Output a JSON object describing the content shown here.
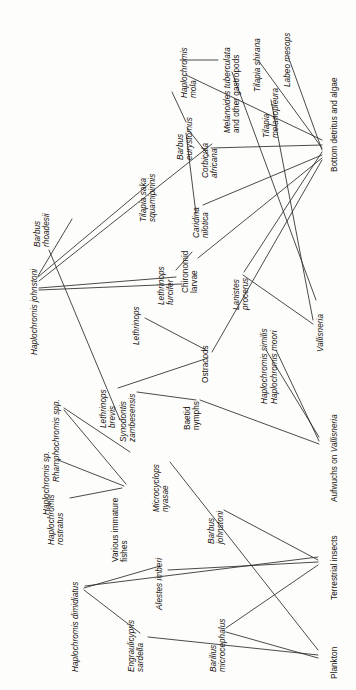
{
  "figure": {
    "type": "food-web-diagram",
    "orientation": "labels rotated 90 degrees counter-clockwise",
    "background_color": "#fdfdfb",
    "line_color": "#2b2b2b",
    "text_color": "#15110d",
    "width": 356,
    "height": 690
  },
  "nodes": [
    {
      "id": "haplochromis_johnstoni",
      "label": "Haplochromis johnstoni",
      "lines": [
        "Haplochromis johnstoni"
      ],
      "style": "italic",
      "x": 30,
      "y": 355,
      "anchor_x": 38,
      "anchor_y": 275
    },
    {
      "id": "barbus_rhoadesii",
      "label": "Barbus rhoadesii",
      "lines": [
        "Barbus",
        "rhoadesii"
      ],
      "style": "italic",
      "x": 33,
      "y": 247,
      "anchor_x": 46,
      "anchor_y": 223
    },
    {
      "id": "rhamphochromis_spp",
      "label": "Rhamphochromis spp.",
      "lines": [
        "Rhamphochromis spp."
      ],
      "style": "italic",
      "x": 52,
      "y": 482,
      "anchor_x": 60,
      "anchor_y": 404
    },
    {
      "id": "haplochromis_sp",
      "label": "Haplochromis sp.",
      "lines": [
        "Haplochromis sp."
      ],
      "style": "italic",
      "x": 42,
      "y": 515,
      "anchor_x": 50,
      "anchor_y": 455
    },
    {
      "id": "haplochromis_rostratus",
      "label": "Haplochromis rostratus",
      "lines": [
        "Haplochromis",
        "rostratus"
      ],
      "style": "italic",
      "x": 47,
      "y": 545,
      "anchor_x": 66,
      "anchor_y": 492
    },
    {
      "id": "haplochromis_dimidiatus",
      "label": "Haplochromis dimidiatus",
      "lines": [
        "Haplochromis dimidiatus"
      ],
      "style": "italic",
      "x": 71,
      "y": 672,
      "anchor_x": 79,
      "anchor_y": 583
    },
    {
      "id": "engraulicypris_sardella",
      "label": "Engraulicypris sardella",
      "lines": [
        "Engraulicypris",
        "sardella"
      ],
      "style": "italic",
      "x": 127,
      "y": 672,
      "anchor_x": 141,
      "anchor_y": 627
    },
    {
      "id": "alestes_imberi",
      "label": "Alestes imberi",
      "lines": [
        "Alestes imberi"
      ],
      "style": "italic",
      "x": 155,
      "y": 610,
      "anchor_x": 163,
      "anchor_y": 562
    },
    {
      "id": "barilius_microcephalus",
      "label": "Barilius microcephalus",
      "lines": [
        "Barilius",
        "microcephalus"
      ],
      "style": "italic",
      "x": 209,
      "y": 672,
      "anchor_x": 222,
      "anchor_y": 620
    },
    {
      "id": "barbus_johnstoni",
      "label": "Barbus johnstoni",
      "lines": [
        "Barbus",
        "johnstoni"
      ],
      "style": "italic",
      "x": 207,
      "y": 544,
      "anchor_x": 220,
      "anchor_y": 500
    },
    {
      "id": "microcyclops_nyasae",
      "label": "Microcyclops nyasae",
      "lines": [
        "Microcyclops",
        "nyasae"
      ],
      "style": "italic",
      "x": 152,
      "y": 512,
      "anchor_x": 166,
      "anchor_y": 455
    },
    {
      "id": "various_immature_fishes",
      "label": "Various immature fishes",
      "lines": [
        "Various immature",
        "fishes"
      ],
      "style": "roman",
      "x": 111,
      "y": 562,
      "anchor_x": 125,
      "anchor_y": 492
    },
    {
      "id": "synodontis_zambesensis",
      "label": "Synodontis zambesensis",
      "lines": [
        "Synodontis",
        "zambesensis"
      ],
      "style": "italic",
      "x": 119,
      "y": 442,
      "anchor_x": 133,
      "anchor_y": 384
    },
    {
      "id": "lethrinops_brevis",
      "label": "Lethrinops brevis",
      "lines": [
        "Lethrinops",
        "brevis"
      ],
      "style": "italic",
      "x": 99,
      "y": 428,
      "anchor_x": 113,
      "anchor_y": 380
    },
    {
      "id": "lethrinops",
      "label": "Lethrinops",
      "lines": [
        "Lethrinops"
      ],
      "style": "italic",
      "x": 132,
      "y": 345,
      "anchor_x": 140,
      "anchor_y": 310
    },
    {
      "id": "lethrinops_furcifer",
      "label": "Lethrinops furcifer",
      "lines": [
        "Lethrinops",
        "furcifer"
      ],
      "style": "italic",
      "x": 157,
      "y": 305,
      "anchor_x": 171,
      "anchor_y": 262
    },
    {
      "id": "baetid_nymphs",
      "label": "Baetid nymphs",
      "lines": [
        "Baetid",
        "nymphs"
      ],
      "style": "roman",
      "x": 183,
      "y": 430,
      "anchor_x": 197,
      "anchor_y": 392
    },
    {
      "id": "ostracods",
      "label": "Ostracods",
      "lines": [
        "Ostracods"
      ],
      "style": "roman",
      "x": 201,
      "y": 383,
      "anchor_x": 209,
      "anchor_y": 345
    },
    {
      "id": "chironomid_larvae",
      "label": "Chironomid larvae",
      "lines": [
        "Chironomid",
        "larvae"
      ],
      "style": "roman",
      "x": 181,
      "y": 293,
      "anchor_x": 195,
      "anchor_y": 248
    },
    {
      "id": "caridina_nilotica",
      "label": "Caridina nilotica",
      "lines": [
        "Caridina",
        "nilotica"
      ],
      "style": "italic",
      "x": 192,
      "y": 238,
      "anchor_x": 206,
      "anchor_y": 196
    },
    {
      "id": "corbicula_africana",
      "label": "Corbicula africana",
      "lines": [
        "Corbicula",
        "africana"
      ],
      "style": "italic",
      "x": 201,
      "y": 178,
      "anchor_x": 215,
      "anchor_y": 134
    },
    {
      "id": "barbus_eurystomus",
      "label": "Barbus eurystomus",
      "lines": [
        "Barbus",
        "eurystomus"
      ],
      "style": "italic",
      "x": 176,
      "y": 160,
      "anchor_x": 190,
      "anchor_y": 110
    },
    {
      "id": "tilapia_saka_squamipinnis",
      "label": "Tilapia saka squamipinnis",
      "lines": [
        "Tilapia saka",
        "squamipinnis"
      ],
      "style": "italic",
      "x": 139,
      "y": 222,
      "anchor_x": 153,
      "anchor_y": 167
    },
    {
      "id": "haplochromis_mola",
      "label": "Haplochromis mola",
      "lines": [
        "Haplochromis",
        "mola"
      ],
      "style": "italic",
      "x": 180,
      "y": 98,
      "anchor_x": 194,
      "anchor_y": 57
    },
    {
      "id": "melanoides_tuberculata",
      "label": "Melanoides tuberculata and other gastropods",
      "lines": [
        "Melanoides tuberculata",
        "and other gastropods"
      ],
      "style": "mixed",
      "x": 223,
      "y": 133,
      "anchor_x": 237,
      "anchor_y": 62
    },
    {
      "id": "lanistes_procerus",
      "label": "Lanistes procerus",
      "lines": [
        "Lanistes",
        "procerus"
      ],
      "style": "italic",
      "x": 232,
      "y": 310,
      "anchor_x": 246,
      "anchor_y": 266
    },
    {
      "id": "haplochromis_similis",
      "label": "Haplochromis similis",
      "lines": [
        "Haplochromis similis"
      ],
      "style": "italic",
      "x": 260,
      "y": 404,
      "anchor_x": 268,
      "anchor_y": 339
    },
    {
      "id": "haplochromis_moori",
      "label": "Haplochromis moori",
      "lines": [
        "Haplochromis moori"
      ],
      "style": "italic",
      "x": 270,
      "y": 404,
      "anchor_x": 278,
      "anchor_y": 339
    },
    {
      "id": "tilapia_melanopleura",
      "label": "Tilapia melanopleura",
      "lines": [
        "Tilapia",
        "melanopleura"
      ],
      "style": "italic",
      "x": 262,
      "y": 138,
      "anchor_x": 276,
      "anchor_y": 88
    },
    {
      "id": "tilapia_shirana",
      "label": "Tilapia shirana",
      "lines": [
        "Tilapia shirana"
      ],
      "style": "italic",
      "x": 253,
      "y": 92,
      "anchor_x": 261,
      "anchor_y": 52
    },
    {
      "id": "labeo_mesops",
      "label": "Labeo mesops",
      "lines": [
        "Labeo mesops"
      ],
      "style": "italic",
      "x": 283,
      "y": 87,
      "anchor_x": 291,
      "anchor_y": 49
    },
    {
      "id": "bottom_detritus_and_algae",
      "label": "Bottom detritus and algae",
      "lines": [
        "Bottom detritus and algae"
      ],
      "style": "roman",
      "x": 330,
      "y": 172,
      "anchor_x": 325,
      "anchor_y": 115
    },
    {
      "id": "vallisneria",
      "label": "Vallisneria",
      "lines": [
        "Vallisneria"
      ],
      "style": "italic",
      "x": 316,
      "y": 352,
      "anchor_x": 311,
      "anchor_y": 315
    },
    {
      "id": "aufwuchs_on_vallisneria",
      "label": "Aufwuchs on Vallisneria",
      "lines": [
        "Aufwuchs on Vallisneria"
      ],
      "style": "mixed-inline",
      "x": 330,
      "y": 502,
      "anchor_x": 325,
      "anchor_y": 440
    },
    {
      "id": "terrestrial_insects",
      "label": "Terrestrial insects",
      "lines": [
        "Terrestrial insects"
      ],
      "style": "roman",
      "x": 330,
      "y": 600,
      "anchor_x": 325,
      "anchor_y": 557
    },
    {
      "id": "plankton",
      "label": "Plankton",
      "lines": [
        "Plankton"
      ],
      "style": "roman",
      "x": 330,
      "y": 679,
      "anchor_x": 325,
      "anchor_y": 652
    }
  ],
  "links": [
    {
      "from": "haplochromis_johnstoni",
      "to": "barbus_rhoadesii",
      "x1": 38,
      "y1": 276,
      "x2": 72,
      "y2": 219
    },
    {
      "from": "haplochromis_johnstoni",
      "to": "tilapia_saka_squamipinnis",
      "x1": 38,
      "y1": 277,
      "x2": 149,
      "y2": 184
    },
    {
      "from": "haplochromis_johnstoni",
      "to": "corbicula_africana",
      "x1": 39,
      "y1": 281,
      "x2": 212,
      "y2": 144
    },
    {
      "from": "haplochromis_johnstoni",
      "to": "lethrinops_furcifer",
      "x1": 39,
      "y1": 288,
      "x2": 176,
      "y2": 277
    },
    {
      "from": "haplochromis_johnstoni",
      "to": "chironomid_larvae",
      "x1": 39,
      "y1": 290,
      "x2": 182,
      "y2": 284
    },
    {
      "from": "barbus_rhoadesii_feed",
      "to": "ostracods",
      "x1": 49,
      "y1": 250,
      "x2": 120,
      "y2": 420
    },
    {
      "from": "barbus_eurystomus",
      "to": "haplochromis_mola",
      "x1": 186,
      "y1": 122,
      "x2": 172,
      "y2": 92
    },
    {
      "from": "barbus_eurystomus",
      "to": "corbicula_africana",
      "x1": 187,
      "y1": 128,
      "x2": 209,
      "y2": 156
    },
    {
      "from": "barbus_eurystomus",
      "to": "caridina_nilotica",
      "x1": 186,
      "y1": 133,
      "x2": 196,
      "y2": 214
    },
    {
      "from": "haplochromis_mola",
      "to": "melanoides_tuberculata",
      "x1": 180,
      "y1": 60,
      "x2": 218,
      "y2": 60
    },
    {
      "from": "haplochromis_mola",
      "to": "bottom_detritus",
      "x1": 186,
      "y1": 75,
      "x2": 322,
      "y2": 140
    },
    {
      "from": "melanoides_tuberculata",
      "to": "bottom_detritus",
      "x1": 232,
      "y1": 72,
      "x2": 316,
      "y2": 300
    },
    {
      "from": "corbicula_africana",
      "to": "bottom_detritus",
      "x1": 211,
      "y1": 148,
      "x2": 322,
      "y2": 145
    },
    {
      "from": "tilapia_shirana",
      "to": "bottom_detritus",
      "x1": 258,
      "y1": 60,
      "x2": 322,
      "y2": 148
    },
    {
      "from": "labeo_mesops",
      "to": "bottom_detritus",
      "x1": 288,
      "y1": 56,
      "x2": 322,
      "y2": 150
    },
    {
      "from": "tilapia_melanopleura",
      "to": "vallisneria",
      "x1": 271,
      "y1": 100,
      "x2": 313,
      "y2": 320
    },
    {
      "from": "lanistes_procerus",
      "to": "vallisneria",
      "x1": 243,
      "y1": 275,
      "x2": 313,
      "y2": 324
    },
    {
      "from": "lanistes_procerus",
      "to": "bottom_detritus",
      "x1": 244,
      "y1": 272,
      "x2": 322,
      "y2": 152
    },
    {
      "from": "haplochromis_similis",
      "to": "aufwuchs",
      "x1": 266,
      "y1": 350,
      "x2": 319,
      "y2": 437
    },
    {
      "from": "haplochromis_moori",
      "to": "aufwuchs",
      "x1": 276,
      "y1": 350,
      "x2": 319,
      "y2": 441
    },
    {
      "from": "caridina_nilotica",
      "to": "bottom_detritus",
      "x1": 203,
      "y1": 205,
      "x2": 322,
      "y2": 155
    },
    {
      "from": "chironomid_larvae",
      "to": "bottom_detritus",
      "x1": 198,
      "y1": 258,
      "x2": 322,
      "y2": 158
    },
    {
      "from": "ostracods",
      "to": "bottom_detritus",
      "x1": 212,
      "y1": 352,
      "x2": 322,
      "y2": 160
    },
    {
      "from": "baetid_nymphs",
      "to": "aufwuchs",
      "x1": 200,
      "y1": 400,
      "x2": 319,
      "y2": 444
    },
    {
      "from": "microcyclops_nyasae",
      "to": "plankton",
      "x1": 170,
      "y1": 462,
      "x2": 318,
      "y2": 650
    },
    {
      "from": "engraulicypris_sardella",
      "to": "plankton",
      "x1": 148,
      "y1": 637,
      "x2": 318,
      "y2": 655
    },
    {
      "from": "barilius_microcephalus",
      "to": "terrestrial_insects",
      "x1": 226,
      "y1": 628,
      "x2": 318,
      "y2": 565
    },
    {
      "from": "barilius_microcephalus",
      "to": "plankton",
      "x1": 226,
      "y1": 632,
      "x2": 318,
      "y2": 658
    },
    {
      "from": "alestes_imberi",
      "to": "terrestrial_insects",
      "x1": 168,
      "y1": 570,
      "x2": 318,
      "y2": 562
    },
    {
      "from": "barbus_johnstoni",
      "to": "terrestrial_insects",
      "x1": 224,
      "y1": 510,
      "x2": 318,
      "y2": 560
    },
    {
      "from": "haplochromis_dimidiatus",
      "to": "engraulicypris_sardella",
      "x1": 84,
      "y1": 590,
      "x2": 140,
      "y2": 633
    },
    {
      "from": "haplochromis_dimidiatus",
      "to": "alestes_imberi",
      "x1": 84,
      "y1": 588,
      "x2": 160,
      "y2": 566
    },
    {
      "from": "haplochromis_dimidiatus",
      "to": "terrestrial_insects",
      "x1": 85,
      "y1": 586,
      "x2": 318,
      "y2": 557
    },
    {
      "from": "haplochromis_rostratus",
      "to": "various_immature_fishes",
      "x1": 70,
      "y1": 498,
      "x2": 122,
      "y2": 488
    },
    {
      "from": "haplochromis_sp",
      "to": "various_immature_fishes",
      "x1": 58,
      "y1": 460,
      "x2": 124,
      "y2": 486
    },
    {
      "from": "rhamphochromis_spp",
      "to": "various_immature_fishes",
      "x1": 64,
      "y1": 410,
      "x2": 126,
      "y2": 484
    },
    {
      "from": "rhamphochromis_spp",
      "to": "synodontis_zambesensis",
      "x1": 64,
      "y1": 408,
      "x2": 130,
      "y2": 452
    },
    {
      "from": "lethrinops_brevis",
      "to": "ostracods",
      "x1": 118,
      "y1": 388,
      "x2": 208,
      "y2": 358
    },
    {
      "from": "synodontis_zambesensis",
      "to": "baetid_nymphs",
      "x1": 137,
      "y1": 392,
      "x2": 196,
      "y2": 400
    },
    {
      "from": "lethrinops",
      "to": "ostracods",
      "x1": 145,
      "y1": 318,
      "x2": 206,
      "y2": 350
    },
    {
      "from": "lethrinops_furcifer",
      "to": "chironomid_larvae",
      "x1": 176,
      "y1": 270,
      "x2": 192,
      "y2": 252
    }
  ]
}
